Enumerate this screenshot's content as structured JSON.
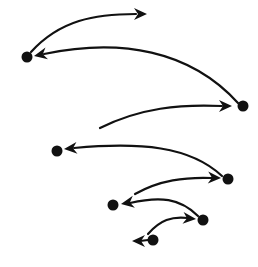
{
  "diagram": {
    "type": "spiral-arrow-sequence",
    "colors": {
      "ink": "#111111",
      "background": "#ffffff"
    },
    "nodes": [
      {
        "id": "n1",
        "x": 27,
        "y": 57
      },
      {
        "id": "n2",
        "x": 243,
        "y": 106
      },
      {
        "id": "n3",
        "x": 57,
        "y": 151
      },
      {
        "id": "n4",
        "x": 228,
        "y": 179
      },
      {
        "id": "n5",
        "x": 113,
        "y": 205
      },
      {
        "id": "n6",
        "x": 203,
        "y": 220
      },
      {
        "id": "n7",
        "x": 153,
        "y": 240
      }
    ],
    "edges": [
      {
        "id": "e0",
        "from": "n1",
        "to": "out-top",
        "path": "M 31 52 C 60 20, 95 14, 136 14",
        "head": {
          "x": 147,
          "y": 14,
          "angle": 0
        }
      },
      {
        "id": "e1",
        "from": "n2",
        "to": "n1",
        "path": "M 238 103 C 190 50, 120 38, 44 54",
        "head": {
          "x": 34,
          "y": 56,
          "angle": 168
        }
      },
      {
        "id": "e2",
        "from": "n3",
        "to": "n2",
        "path": "M 100 128 C 140 108, 180 104, 222 106",
        "head": {
          "x": 232,
          "y": 106,
          "angle": 0
        }
      },
      {
        "id": "e3",
        "from": "n4",
        "to": "n3",
        "path": "M 222 176 C 190 146, 140 142, 74 148",
        "head": {
          "x": 64,
          "y": 149,
          "angle": 175
        }
      },
      {
        "id": "e4",
        "from": "n5",
        "to": "n4",
        "path": "M 135 194 C 160 180, 185 177, 212 178",
        "head": {
          "x": 221,
          "y": 178,
          "angle": 2
        }
      },
      {
        "id": "e5",
        "from": "n6",
        "to": "n5",
        "path": "M 198 216 C 180 198, 160 196, 130 203",
        "head": {
          "x": 121,
          "y": 204,
          "angle": 170
        }
      },
      {
        "id": "e6",
        "from": "n7",
        "to": "n6",
        "path": "M 148 234 C 160 220, 172 216, 188 218",
        "head": {
          "x": 196,
          "y": 219,
          "angle": 5
        }
      },
      {
        "id": "e7",
        "from": "n7",
        "to": "out-left",
        "path": "M 148 240 L 140 241",
        "head": {
          "x": 132,
          "y": 241,
          "angle": 180
        }
      }
    ]
  }
}
